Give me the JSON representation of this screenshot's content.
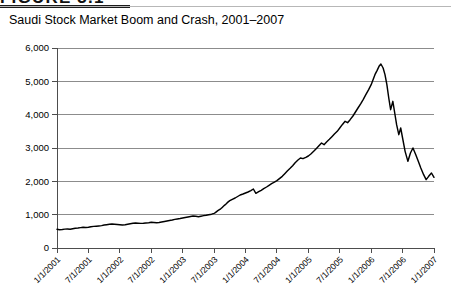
{
  "figure": {
    "header_label": "FIGURE 3.1",
    "title": "Saudi Stock Market Boom and Crash, 2001–2007"
  },
  "chart_data": {
    "type": "line",
    "title": "Saudi Stock Market Boom and Crash, 2001–2007",
    "xlabel": "",
    "ylabel": "",
    "ylim": [
      0,
      6000
    ],
    "ytick_labels": [
      "6,000",
      "5,000",
      "4,000",
      "3,000",
      "2,000",
      "1,000",
      "0"
    ],
    "ytick_values": [
      6000,
      5000,
      4000,
      3000,
      2000,
      1000,
      0
    ],
    "xtick_labels": [
      "1/1/2001",
      "7/1/2001",
      "1/1/2002",
      "7/1/2002",
      "1/1/2003",
      "7/1/2003",
      "1/1/2004",
      "7/1/2004",
      "1/1/2005",
      "7/1/2005",
      "1/1/2006",
      "7/1/2006",
      "1/1/2007"
    ],
    "grid": true,
    "legend": "none",
    "series": [
      {
        "name": "Tadawul All Share Index",
        "color": "#000000",
        "x": [
          0.0,
          0.08,
          0.17,
          0.25,
          0.33,
          0.42,
          0.5,
          0.58,
          0.67,
          0.75,
          0.83,
          0.92,
          1.0,
          1.08,
          1.17,
          1.25,
          1.33,
          1.42,
          1.5,
          1.58,
          1.67,
          1.75,
          1.83,
          1.92,
          2.0,
          2.08,
          2.17,
          2.25,
          2.33,
          2.42,
          2.5,
          2.58,
          2.67,
          2.75,
          2.83,
          2.92,
          3.0,
          3.08,
          3.17,
          3.25,
          3.33,
          3.42,
          3.5,
          3.58,
          3.67,
          3.75,
          3.83,
          3.92,
          4.0,
          4.08,
          4.17,
          4.25,
          4.33,
          4.42,
          4.5,
          4.58,
          4.67,
          4.75,
          4.83,
          4.92,
          5.0,
          5.04,
          5.08,
          5.12,
          5.17,
          5.21,
          5.25,
          5.29,
          5.33,
          5.38,
          5.42,
          5.46,
          5.5,
          5.58,
          5.67,
          5.75,
          5.83,
          5.92,
          6.0,
          6.08,
          6.17,
          6.25,
          6.33,
          6.42,
          6.5,
          6.58,
          6.67,
          6.75,
          6.83,
          6.92,
          7.0,
          7.08,
          7.17,
          7.25,
          7.33,
          7.42,
          7.5,
          7.58,
          7.67,
          7.75,
          7.83,
          7.92,
          8.0,
          8.08,
          8.17,
          8.25,
          8.33,
          8.42,
          8.5,
          8.58,
          8.67,
          8.75,
          8.83,
          8.92,
          9.0,
          9.08,
          9.17,
          9.25,
          9.33,
          9.42,
          9.5,
          9.58,
          9.67,
          9.75,
          9.83,
          9.92,
          10.0,
          10.06,
          10.12,
          10.19,
          10.25,
          10.31,
          10.38,
          10.44,
          10.5,
          10.56,
          10.62,
          10.69,
          10.75,
          10.81,
          10.88,
          10.94,
          11.0,
          11.08,
          11.17,
          11.25,
          11.33,
          11.42,
          11.5,
          11.58,
          11.67,
          11.75,
          11.83,
          11.92,
          12.0
        ],
        "y": [
          560,
          548,
          555,
          566,
          572,
          560,
          575,
          590,
          600,
          612,
          620,
          615,
          625,
          640,
          648,
          655,
          662,
          672,
          690,
          700,
          710,
          718,
          712,
          705,
          700,
          690,
          700,
          715,
          730,
          745,
          752,
          745,
          738,
          742,
          750,
          760,
          772,
          765,
          758,
          766,
          780,
          795,
          810,
          826,
          840,
          858,
          872,
          885,
          900,
          915,
          930,
          945,
          960,
          950,
          940,
          955,
          972,
          985,
          1000,
          1015,
          1040,
          1060,
          1090,
          1120,
          1150,
          1175,
          1210,
          1245,
          1280,
          1320,
          1360,
          1390,
          1420,
          1460,
          1500,
          1545,
          1590,
          1620,
          1650,
          1680,
          1720,
          1770,
          1640,
          1690,
          1730,
          1780,
          1830,
          1880,
          1930,
          1975,
          2020,
          2080,
          2150,
          2230,
          2310,
          2390,
          2470,
          2560,
          2640,
          2700,
          2680,
          2720,
          2760,
          2820,
          2900,
          2980,
          3060,
          3150,
          3100,
          3180,
          3260,
          3340,
          3420,
          3500,
          3600,
          3700,
          3800,
          3760,
          3850,
          3960,
          4080,
          4200,
          4330,
          4460,
          4600,
          4750,
          4900,
          5050,
          5200,
          5330,
          5450,
          5520,
          5400,
          5200,
          4900,
          4500,
          4150,
          4400,
          4050,
          3700,
          3400,
          3600,
          3300,
          2900,
          2600,
          2850,
          3000,
          2800,
          2600,
          2400,
          2200,
          2050,
          2150,
          2250,
          2120
        ]
      }
    ]
  }
}
